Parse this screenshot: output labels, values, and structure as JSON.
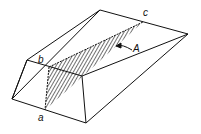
{
  "diagram": {
    "type": "3d-prism-wedge",
    "labels": {
      "a": "a",
      "b": "b",
      "c": "c",
      "A": "A"
    },
    "colors": {
      "stroke": "#111111",
      "background": "#ffffff"
    }
  }
}
